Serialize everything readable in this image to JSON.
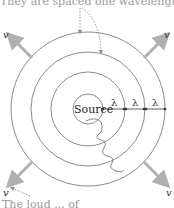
{
  "captions": {
    "top": "They are spaced one wavelength apart.",
    "bottom": "The loud ... of"
  },
  "diagram": {
    "source_label": "Source",
    "wavelength_symbol": "λ",
    "wavelength_labels": [
      "λ",
      "λ",
      "λ"
    ],
    "velocity_labels": [
      "v",
      "v",
      "v",
      "v"
    ],
    "center": [
      88,
      109
    ],
    "radii": [
      15,
      37,
      57,
      77
    ],
    "colors": {
      "circle": "#8c8c8c",
      "arrow": "#b0b0b0",
      "text": "#222222",
      "dotted": "#8c8c8c"
    }
  }
}
